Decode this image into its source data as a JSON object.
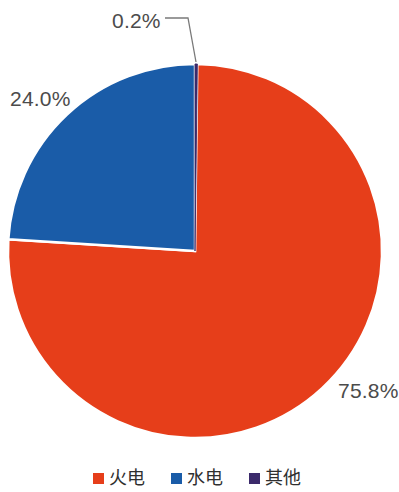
{
  "chart_data": {
    "type": "pie",
    "title": "",
    "subtitle": "",
    "xlabel": "",
    "ylabel": "",
    "legend_position": "bottom",
    "grid": false,
    "categories": [
      "火电",
      "水电",
      "其他"
    ],
    "values": [
      75.8,
      24.0,
      0.2
    ],
    "value_unit": "%",
    "colors": [
      "#e63e1a",
      "#1a5ca8",
      "#3b2a6b"
    ],
    "slices": [
      {
        "name": "火电",
        "value": 75.8,
        "label": "75.8%",
        "color": "#e63e1a",
        "start_angle": 0.72,
        "end_angle": 273.6,
        "label_position": "outside-bottom-right",
        "has_leader_line": false
      },
      {
        "name": "水电",
        "value": 24.0,
        "label": "24.0%",
        "color": "#1a5ca8",
        "start_angle": 273.6,
        "end_angle": 360.0,
        "label_position": "outside-left",
        "has_leader_line": false
      },
      {
        "name": "其他",
        "value": 0.2,
        "label": "0.2%",
        "color": "#3b2a6b",
        "start_angle": 0.0,
        "end_angle": 0.72,
        "label_position": "outside-top-left",
        "has_leader_line": true
      }
    ],
    "start_angle_deg": 0,
    "direction": "clockwise",
    "geometry": {
      "center_x": 195,
      "center_y": 251,
      "radius": 187,
      "slice_gap_color": "#ffffff"
    }
  },
  "labels": {
    "other": "0.2%",
    "hydro": "24.0%",
    "thermal": "75.8%"
  },
  "legend": {
    "items": [
      {
        "label": "火电",
        "color": "#e63e1a"
      },
      {
        "label": "水电",
        "color": "#1a5ca8"
      },
      {
        "label": "其他",
        "color": "#3b2a6b"
      }
    ]
  },
  "colors": {
    "thermal": "#e63e1a",
    "hydro": "#1a5ca8",
    "other": "#3b2a6b",
    "label_text": "#4b4b4b",
    "legend_text": "#2f2f2f",
    "leader_line": "#7a7a7a",
    "background": "#ffffff"
  }
}
